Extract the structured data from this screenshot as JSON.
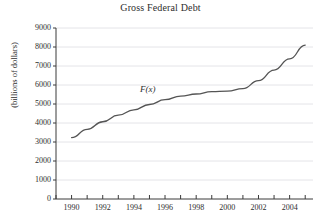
{
  "chart_data": {
    "type": "line",
    "title": "Gross Federal Debt",
    "xlabel": "",
    "ylabel": "(billions of dollars)",
    "series_label": "F(x)",
    "grid": "horizontal",
    "legend": "inline-annotation",
    "xlim": [
      1989,
      2005.5
    ],
    "ylim": [
      0,
      9000
    ],
    "ytick_labels": [
      "9000",
      "8000",
      "7000",
      "6000",
      "5000",
      "4000",
      "3000",
      "2000",
      "1000",
      "0"
    ],
    "ytick_values": [
      9000,
      8000,
      7000,
      6000,
      5000,
      4000,
      3000,
      2000,
      1000,
      0
    ],
    "xtick_labels": [
      "1990",
      "1992",
      "1994",
      "1996",
      "1998",
      "2000",
      "2002",
      "2004"
    ],
    "xtick_values": [
      1990,
      1992,
      1994,
      1996,
      1998,
      2000,
      2002,
      2004
    ],
    "xminor_ticks": [
      1989,
      1991,
      1993,
      1995,
      1997,
      1999,
      2001,
      2003,
      2005
    ],
    "x": [
      1990,
      1991,
      1992,
      1993,
      1994,
      1995,
      1996,
      1997,
      1998,
      1999,
      2000,
      2001,
      2002,
      2003,
      2004,
      2005
    ],
    "values": [
      3233,
      3665,
      4065,
      4411,
      4693,
      4974,
      5225,
      5413,
      5526,
      5656,
      5674,
      5807,
      6228,
      6783,
      7379,
      8100
    ],
    "line_color": "#555555",
    "grid_color": "#e4e4e8",
    "axis_color": "#3a3a3a"
  }
}
